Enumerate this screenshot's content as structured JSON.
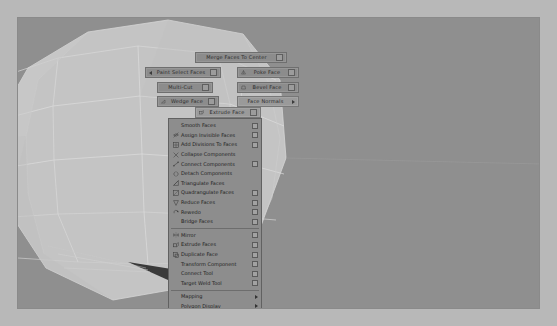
{
  "app": {
    "name": "Autodesk Maya",
    "viewport_label": "persp",
    "background_color": "#8f8f8f",
    "mesh_color": "#c8c8c8",
    "wire_color": "#d8d8d8",
    "shadow_color": "#2f2f2f"
  },
  "marking_menu": {
    "title": "Faces Marking Menu",
    "center": {
      "x": 240,
      "y": 86
    },
    "items": [
      {
        "id": "merge-faces-to-center",
        "label": "Merge Faces To Center",
        "x": 194,
        "y": 51,
        "w": 92,
        "icon": "none",
        "option_box": true,
        "submenu": false,
        "align": "N",
        "highlight": false
      },
      {
        "id": "paint-select-faces",
        "label": "Paint Select Faces",
        "x": 144,
        "y": 66,
        "w": 76,
        "icon": "arrow-left",
        "option_box": true,
        "submenu": false,
        "align": "W",
        "highlight": false
      },
      {
        "id": "poke-face",
        "label": "Poke Face",
        "x": 236,
        "y": 66,
        "w": 62,
        "icon": "poke",
        "option_box": true,
        "submenu": false,
        "align": "E",
        "highlight": false
      },
      {
        "id": "multi-cut",
        "label": "Multi-Cut",
        "x": 156,
        "y": 81,
        "w": 56,
        "icon": "none",
        "option_box": true,
        "submenu": false,
        "align": "NW",
        "highlight": false
      },
      {
        "id": "bevel-face",
        "label": "Bevel Face",
        "x": 236,
        "y": 81,
        "w": 62,
        "icon": "bevel",
        "option_box": true,
        "submenu": false,
        "align": "NE",
        "highlight": false
      },
      {
        "id": "wedge-face",
        "label": "Wedge Face",
        "x": 156,
        "y": 95,
        "w": 62,
        "icon": "wedge",
        "option_box": true,
        "submenu": false,
        "align": "SW",
        "highlight": false
      },
      {
        "id": "face-normals",
        "label": "Face Normals",
        "x": 236,
        "y": 95,
        "w": 62,
        "icon": "none",
        "option_box": false,
        "submenu": true,
        "align": "SE",
        "highlight": true
      },
      {
        "id": "extrude-face",
        "label": "Extrude Face",
        "x": 194,
        "y": 106,
        "w": 66,
        "icon": "extrude",
        "option_box": true,
        "submenu": false,
        "align": "S",
        "highlight": true
      }
    ]
  },
  "context_menu": {
    "x": 167,
    "y": 117,
    "width": 94,
    "items": [
      {
        "id": "smooth-faces",
        "label": "Smooth Faces",
        "icon": "none",
        "option_box": true,
        "submenu": false,
        "separator_after": false
      },
      {
        "id": "assign-invisible",
        "label": "Assign Invisible Faces",
        "icon": "invisible",
        "option_box": true,
        "submenu": false,
        "separator_after": false
      },
      {
        "id": "add-divisions",
        "label": "Add Divisions To Faces",
        "icon": "divide",
        "option_box": true,
        "submenu": false,
        "separator_after": false
      },
      {
        "id": "collapse-components",
        "label": "Collapse Components",
        "icon": "collapse",
        "option_box": false,
        "submenu": false,
        "separator_after": false
      },
      {
        "id": "connect-components",
        "label": "Connect Components",
        "icon": "connect",
        "option_box": true,
        "submenu": false,
        "separator_after": false
      },
      {
        "id": "detach-components",
        "label": "Detach Components",
        "icon": "detach",
        "option_box": false,
        "submenu": false,
        "separator_after": false
      },
      {
        "id": "triangulate-faces",
        "label": "Triangulate Faces",
        "icon": "tri",
        "option_box": false,
        "submenu": false,
        "separator_after": false
      },
      {
        "id": "quadrangulate-faces",
        "label": "Quadrangulate Faces",
        "icon": "quad",
        "option_box": true,
        "submenu": false,
        "separator_after": false
      },
      {
        "id": "reduce-faces",
        "label": "Reduce Faces",
        "icon": "reduce",
        "option_box": true,
        "submenu": false,
        "separator_after": false
      },
      {
        "id": "rewedo",
        "label": "Rewedo",
        "icon": "rewedo",
        "option_box": true,
        "submenu": false,
        "separator_after": false
      },
      {
        "id": "bridge-faces",
        "label": "Bridge Faces",
        "icon": "none",
        "option_box": true,
        "submenu": false,
        "separator_after": true
      },
      {
        "id": "mirror",
        "label": "Mirror",
        "icon": "mirror",
        "option_box": true,
        "submenu": false,
        "separator_after": false
      },
      {
        "id": "extrude-faces",
        "label": "Extrude Faces",
        "icon": "extrude",
        "option_box": true,
        "submenu": false,
        "separator_after": false
      },
      {
        "id": "duplicate-face",
        "label": "Duplicate Face",
        "icon": "dup",
        "option_box": true,
        "submenu": false,
        "separator_after": false
      },
      {
        "id": "transform-component",
        "label": "Transform Component",
        "icon": "none",
        "option_box": true,
        "submenu": false,
        "separator_after": false
      },
      {
        "id": "connect-tool",
        "label": "Connect Tool",
        "icon": "none",
        "option_box": true,
        "submenu": false,
        "separator_after": false
      },
      {
        "id": "target-weld-tool",
        "label": "Target Weld Tool",
        "icon": "none",
        "option_box": true,
        "submenu": false,
        "separator_after": true
      },
      {
        "id": "mapping",
        "label": "Mapping",
        "icon": "none",
        "option_box": false,
        "submenu": true,
        "separator_after": false
      },
      {
        "id": "polygon-display",
        "label": "Polygon Display",
        "icon": "none",
        "option_box": false,
        "submenu": true,
        "separator_after": false
      },
      {
        "id": "remachine",
        "label": "Remachine",
        "icon": "none",
        "option_box": false,
        "submenu": true,
        "separator_after": false
      }
    ]
  }
}
